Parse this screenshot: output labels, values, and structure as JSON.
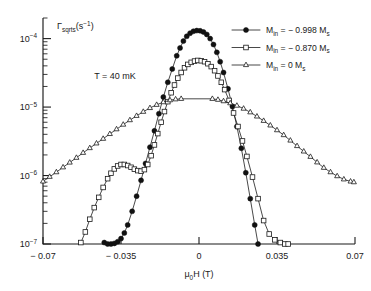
{
  "figure": {
    "title": "",
    "annotation": "T = 40 mK",
    "background": "#ffffff",
    "ink_color": "#1a1a1a"
  },
  "axes": {
    "ylabel_main": "Γ",
    "ylabel_sub": "sqrts",
    "ylabel_unit": "(s",
    "ylabel_unit_sup": "−1",
    "ylabel_unit_close": ")",
    "xlabel_main": "μ",
    "xlabel_sub": "0",
    "xlabel_rest": "H (T)",
    "x_ticklabels": [
      "− 0.07",
      "− 0.035",
      "0",
      "0.035",
      "0.07"
    ],
    "y_ticklabels": [
      {
        "base": "10",
        "exp": "−4"
      },
      {
        "base": "10",
        "exp": "−5"
      },
      {
        "base": "10",
        "exp": "−6"
      },
      {
        "base": "10",
        "exp": "−7"
      }
    ]
  },
  "legend": {
    "entries": [
      {
        "marker": "filled-circle",
        "prefix": "M",
        "sub": "in",
        "value": " = − 0.998 M",
        "value_sub": "s"
      },
      {
        "marker": "open-square",
        "prefix": "M",
        "sub": "in",
        "value": " = − 0.870 M",
        "value_sub": "s"
      },
      {
        "marker": "open-triangle",
        "prefix": "M",
        "sub": "in",
        "value": " = 0 M",
        "value_sub": "s"
      }
    ]
  },
  "chart_data": {
    "type": "line",
    "title": "",
    "xlabel": "μ0H (T)",
    "ylabel": "Γ_sqrts (s^-1)",
    "xlim": [
      -0.07,
      0.07
    ],
    "ylim": [
      1e-07,
      0.0002
    ],
    "yscale": "log",
    "xticks": [
      -0.07,
      -0.035,
      0,
      0.035,
      0.07
    ],
    "yticks": [
      0.0001,
      1e-05,
      1e-06,
      1e-07
    ],
    "grid": false,
    "legend_position": "upper right",
    "annotations": [
      {
        "text": "T = 40 mK",
        "x": -0.047,
        "y": 2.6e-05
      }
    ],
    "series": [
      {
        "name": "M_in = - 0.998 M_s",
        "marker": "filled-circle",
        "x": [
          -0.0425,
          -0.041,
          -0.0395,
          -0.038,
          -0.0365,
          -0.035,
          -0.0335,
          -0.032,
          -0.03,
          -0.028,
          -0.026,
          -0.024,
          -0.022,
          -0.02,
          -0.018,
          -0.016,
          -0.014,
          -0.012,
          -0.01,
          -0.0085,
          -0.007,
          -0.0055,
          -0.004,
          -0.0025,
          -0.001,
          0.0005,
          0.002,
          0.0035,
          0.005,
          0.0065,
          0.008,
          0.0095,
          0.011,
          0.013,
          0.015,
          0.017,
          0.019,
          0.021,
          0.023,
          0.025,
          0.0265
        ],
        "y": [
          1.05e-07,
          1e-07,
          1e-07,
          1.02e-07,
          1.08e-07,
          1.2e-07,
          1.45e-07,
          1.9e-07,
          3e-07,
          5e-07,
          8.5e-07,
          1.5e-06,
          2.6e-06,
          4.5e-06,
          8e-06,
          1.4e-05,
          2.3e-05,
          3.6e-05,
          5.6e-05,
          7.3e-05,
          9.2e-05,
          0.000108,
          0.00012,
          0.000128,
          0.000131,
          0.00013,
          0.000125,
          0.000115,
          0.0001,
          8.2e-05,
          6.3e-05,
          4.6e-05,
          3.2e-05,
          1.85e-05,
          1.02e-05,
          5.2e-06,
          2.5e-06,
          1.1e-06,
          4.6e-07,
          1.9e-07,
          1e-07
        ]
      },
      {
        "name": "M_in = - 0.870 M_s",
        "marker": "open-square",
        "x": [
          -0.053,
          -0.051,
          -0.049,
          -0.047,
          -0.045,
          -0.043,
          -0.041,
          -0.0395,
          -0.038,
          -0.0365,
          -0.035,
          -0.0335,
          -0.032,
          -0.0305,
          -0.029,
          -0.0275,
          -0.026,
          -0.0245,
          -0.023,
          -0.0215,
          -0.02,
          -0.0185,
          -0.017,
          -0.0155,
          -0.014,
          -0.0125,
          -0.011,
          -0.0095,
          -0.008,
          -0.0065,
          -0.005,
          -0.0035,
          -0.002,
          -0.0005,
          0.001,
          0.0025,
          0.004,
          0.0055,
          0.007,
          0.0085,
          0.01,
          0.0115,
          0.0135,
          0.0155,
          0.0175,
          0.0195,
          0.0215,
          0.024,
          0.0265,
          0.029,
          0.0315,
          0.034,
          0.0365,
          0.0385,
          0.04
        ],
        "y": [
          1.05e-07,
          1.5e-07,
          2.3e-07,
          3.4e-07,
          4.8e-07,
          6.7e-07,
          9e-07,
          1.08e-06,
          1.25e-06,
          1.38e-06,
          1.45e-06,
          1.45e-06,
          1.4e-06,
          1.32e-06,
          1.24e-06,
          1.18e-06,
          1.16e-06,
          1.22e-06,
          1.45e-06,
          1.95e-06,
          2.8e-06,
          4.1e-06,
          6e-06,
          8.6e-06,
          1.2e-05,
          1.62e-05,
          2.1e-05,
          2.65e-05,
          3.2e-05,
          3.75e-05,
          4.2e-05,
          4.5e-05,
          4.7e-05,
          4.8e-05,
          4.75e-05,
          4.6e-05,
          4.3e-05,
          3.9e-05,
          3.4e-05,
          2.85e-05,
          2.3e-05,
          1.8e-05,
          1.25e-05,
          8.2e-06,
          5.2e-06,
          3.2e-06,
          1.9e-06,
          9.5e-07,
          4.6e-07,
          2.2e-07,
          1.4e-07,
          1.15e-07,
          1.05e-07,
          1e-07,
          1e-07
        ]
      },
      {
        "name": "M_in = 0 M_s",
        "marker": "open-triangle",
        "x": [
          -0.07,
          -0.067,
          -0.064,
          -0.061,
          -0.058,
          -0.055,
          -0.052,
          -0.049,
          -0.046,
          -0.043,
          -0.04,
          -0.037,
          -0.034,
          -0.031,
          -0.028,
          -0.025,
          -0.022,
          -0.019,
          -0.016,
          -0.013,
          -0.0105,
          -0.008,
          0.006,
          0.0085,
          0.011,
          0.014,
          0.017,
          0.02,
          0.023,
          0.026,
          0.029,
          0.032,
          0.035,
          0.038,
          0.041,
          0.044,
          0.047,
          0.05,
          0.053,
          0.056,
          0.059,
          0.062,
          0.065,
          0.068,
          0.0695
        ],
        "y": [
          8.2e-07,
          9.6e-07,
          1.12e-06,
          1.32e-06,
          1.55e-06,
          1.82e-06,
          2.15e-06,
          2.52e-06,
          2.95e-06,
          3.45e-06,
          4.05e-06,
          4.75e-06,
          5.55e-06,
          6.45e-06,
          7.45e-06,
          8.55e-06,
          9.7e-06,
          1.08e-05,
          1.18e-05,
          1.26e-05,
          1.3e-05,
          1.32e-05,
          1.32e-05,
          1.28e-05,
          1.22e-05,
          1.14e-05,
          1.05e-05,
          9.5e-06,
          8.4e-06,
          7.3e-06,
          6.3e-06,
          5.4e-06,
          4.6e-06,
          3.9e-06,
          3.25e-06,
          2.7e-06,
          2.25e-06,
          1.88e-06,
          1.56e-06,
          1.3e-06,
          1.12e-06,
          9.8e-07,
          8.8e-07,
          8.2e-07,
          8e-07
        ]
      }
    ]
  }
}
